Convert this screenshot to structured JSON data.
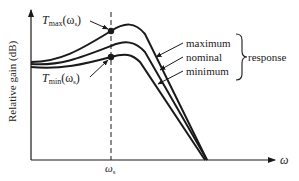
{
  "diagram": {
    "type": "frequency-response-sketch",
    "y_axis_label": "Relative gain (dB)",
    "x_axis_label": "ω",
    "x_tick_label": {
      "main": "ω",
      "sub": "s"
    },
    "points": {
      "tmax": {
        "main": "T",
        "sub": "max",
        "arg": "(ω",
        "argsub": "s",
        "close": ")"
      },
      "tmin": {
        "main": "T",
        "sub": "min",
        "arg": "(ω",
        "argsub": "s",
        "close": ")"
      }
    },
    "curves": [
      {
        "name": "maximum",
        "label": "maximum"
      },
      {
        "name": "nominal",
        "label": "nominal"
      },
      {
        "name": "minimum",
        "label": "minimum"
      }
    ],
    "group_label": "response",
    "colors": {
      "ink": "#1a1a1a",
      "background": "#ffffff"
    }
  }
}
